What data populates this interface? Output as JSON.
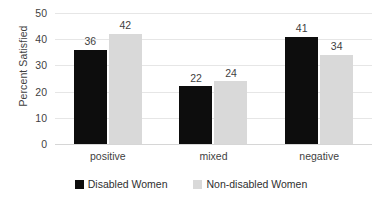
{
  "chart_data": {
    "type": "bar",
    "title": "",
    "subtitle": "",
    "xlabel": "",
    "ylabel": "Percent Satisfied",
    "categories": [
      "positive",
      "mixed",
      "negative"
    ],
    "series": [
      {
        "name": "Disabled Women",
        "color": "#0d0d0d",
        "values": [
          36,
          22,
          41
        ]
      },
      {
        "name": "Non-disabled Women",
        "color": "#d9d9d9",
        "values": [
          42,
          24,
          34
        ]
      }
    ],
    "ylim": [
      0,
      50
    ],
    "yticks": [
      0,
      10,
      20,
      30,
      40,
      50
    ],
    "ytick_labels": [
      "0",
      "10",
      "20",
      "30",
      "40",
      "50"
    ],
    "grid": "horizontal",
    "legend_position": "bottom-center",
    "data_labels": true,
    "background_color": "#ffffff",
    "gridline_color": "#e6e6e6",
    "text_color": "#3f3f3f"
  }
}
